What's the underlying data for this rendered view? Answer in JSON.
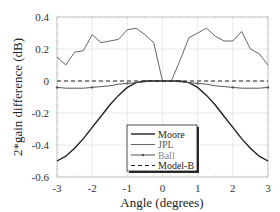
{
  "chart_data": {
    "type": "line",
    "title": "",
    "xlabel": "Angle (degrees)",
    "ylabel": "2*gain difference (dB)",
    "xlim": [
      -3,
      3
    ],
    "ylim": [
      -0.6,
      0.4
    ],
    "xticks": [
      "-3",
      "-2",
      "-1",
      "0",
      "1",
      "2",
      "3"
    ],
    "yticks": [
      "0.4",
      "0.2",
      "0",
      "-0.2",
      "-0.4",
      "-0.6"
    ],
    "grid": true,
    "legend_position": "lower center",
    "x": [
      -3.0,
      -2.75,
      -2.5,
      -2.25,
      -2.0,
      -1.75,
      -1.5,
      -1.25,
      -1.0,
      -0.75,
      -0.5,
      -0.25,
      0.0,
      0.25,
      0.5,
      0.75,
      1.0,
      1.25,
      1.5,
      1.75,
      2.0,
      2.25,
      2.5,
      2.75,
      3.0
    ],
    "series": [
      {
        "name": "Moore",
        "color": "#222222",
        "style": "solid-thick",
        "values": [
          -0.5,
          -0.47,
          -0.42,
          -0.36,
          -0.29,
          -0.22,
          -0.15,
          -0.09,
          -0.04,
          -0.01,
          0.0,
          0.0,
          0.0,
          0.0,
          0.0,
          -0.01,
          -0.04,
          -0.09,
          -0.15,
          -0.22,
          -0.29,
          -0.36,
          -0.42,
          -0.47,
          -0.5
        ]
      },
      {
        "name": "JPL",
        "color": "#666666",
        "style": "solid",
        "values": [
          0.15,
          0.1,
          0.18,
          0.19,
          0.29,
          0.24,
          0.25,
          0.26,
          0.32,
          0.33,
          0.29,
          0.24,
          0.0,
          0.0,
          0.13,
          0.27,
          0.3,
          0.33,
          0.28,
          0.25,
          0.25,
          0.31,
          0.2,
          0.17,
          0.1
        ]
      },
      {
        "name": "Ball",
        "color": "#555555",
        "style": "solid-marker",
        "values": [
          -0.04,
          -0.045,
          -0.045,
          -0.045,
          -0.04,
          -0.035,
          -0.03,
          -0.02,
          -0.015,
          -0.01,
          -0.005,
          0.0,
          0.0,
          0.0,
          -0.005,
          -0.01,
          -0.015,
          -0.02,
          -0.03,
          -0.035,
          -0.04,
          -0.045,
          -0.045,
          -0.045,
          -0.04
        ]
      },
      {
        "name": "Model-B",
        "color": "#222222",
        "style": "dashed",
        "values": [
          0,
          0,
          0,
          0,
          0,
          0,
          0,
          0,
          0,
          0,
          0,
          0,
          0,
          0,
          0,
          0,
          0,
          0,
          0,
          0,
          0,
          0,
          0,
          0,
          0
        ]
      }
    ]
  }
}
